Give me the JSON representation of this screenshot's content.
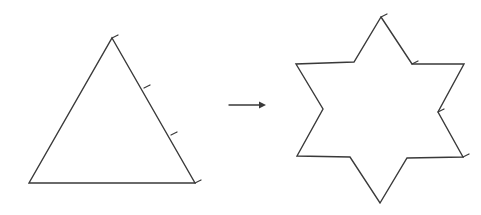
{
  "diagram": {
    "stroke_color": "#3a3a3a",
    "background": "#ffffff",
    "triangle": {
      "points": [
        [
          112,
          38
        ],
        [
          195,
          183
        ],
        [
          29,
          183
        ]
      ],
      "ticks": [
        [
          112,
          38
        ],
        [
          144,
          88
        ],
        [
          171,
          135
        ],
        [
          195,
          183
        ]
      ]
    },
    "arrow": {
      "from": [
        229,
        105
      ],
      "to": [
        266,
        105
      ]
    },
    "star": {
      "points": [
        [
          381,
          17
        ],
        [
          412,
          64
        ],
        [
          464,
          64
        ],
        [
          438,
          112
        ],
        [
          463,
          157
        ],
        [
          407,
          158
        ],
        [
          380,
          203
        ],
        [
          350,
          157
        ],
        [
          297,
          156
        ],
        [
          323,
          109
        ],
        [
          296,
          64
        ],
        [
          354,
          62
        ]
      ],
      "ticks": [
        [
          381,
          17
        ],
        [
          412,
          64
        ],
        [
          438,
          112
        ],
        [
          463,
          157
        ]
      ]
    }
  }
}
